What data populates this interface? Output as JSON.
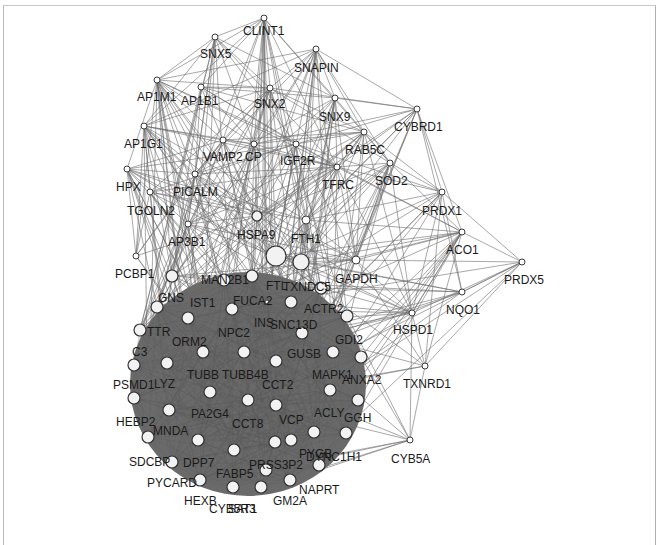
{
  "diagram": {
    "type": "protein-protein interaction network",
    "canvas": {
      "width": 665,
      "height": 532
    },
    "colors": {
      "background": "#ffffff",
      "edge": "#6e6e6e",
      "dense_cluster": "#6a6a6a",
      "node_fill": "#ffffff",
      "node_stroke": "#3a3a3a",
      "label": "#1a1a1a"
    },
    "nodes": [
      {
        "id": "CLINT1",
        "x": 264,
        "y": 18,
        "r": 3,
        "lx": 243,
        "ly": 35
      },
      {
        "id": "SNX5",
        "x": 215,
        "y": 37,
        "r": 3,
        "lx": 200,
        "ly": 58
      },
      {
        "id": "SNAPIN",
        "x": 316,
        "y": 49,
        "r": 3,
        "lx": 294,
        "ly": 72
      },
      {
        "id": "AP1M1",
        "x": 157,
        "y": 80,
        "r": 3,
        "lx": 137,
        "ly": 101
      },
      {
        "id": "AP1B1",
        "x": 201,
        "y": 87,
        "r": 3,
        "lx": 181,
        "ly": 105
      },
      {
        "id": "SNX2",
        "x": 270,
        "y": 88,
        "r": 3,
        "lx": 254,
        "ly": 108
      },
      {
        "id": "SNX9",
        "x": 335,
        "y": 98,
        "r": 3,
        "lx": 319,
        "ly": 121
      },
      {
        "id": "AP1G1",
        "x": 144,
        "y": 126,
        "r": 3,
        "lx": 124,
        "ly": 148
      },
      {
        "id": "RAB5C",
        "x": 364,
        "y": 132,
        "r": 3,
        "lx": 345,
        "ly": 154
      },
      {
        "id": "CYBRD1",
        "x": 417,
        "y": 109,
        "r": 3,
        "lx": 394,
        "ly": 131
      },
      {
        "id": "VAMP2",
        "x": 223,
        "y": 140,
        "r": 3,
        "lx": 203,
        "ly": 161
      },
      {
        "id": "CP",
        "x": 254,
        "y": 144,
        "r": 3,
        "lx": 245,
        "ly": 161
      },
      {
        "id": "IGF2R",
        "x": 296,
        "y": 144,
        "r": 3,
        "lx": 280,
        "ly": 165
      },
      {
        "id": "HPX",
        "x": 127,
        "y": 169,
        "r": 3,
        "lx": 116,
        "ly": 191
      },
      {
        "id": "PICALM",
        "x": 195,
        "y": 174,
        "r": 3,
        "lx": 173,
        "ly": 196
      },
      {
        "id": "TFRC",
        "x": 337,
        "y": 167,
        "r": 3,
        "lx": 322,
        "ly": 189
      },
      {
        "id": "SOD2",
        "x": 390,
        "y": 163,
        "r": 3,
        "lx": 375,
        "ly": 185
      },
      {
        "id": "TGOLN2",
        "x": 150,
        "y": 192,
        "r": 3,
        "lx": 127,
        "ly": 215
      },
      {
        "id": "PRDX1",
        "x": 442,
        "y": 192,
        "r": 3,
        "lx": 422,
        "ly": 215
      },
      {
        "id": "HSPA9",
        "x": 257,
        "y": 216,
        "r": 5,
        "lx": 237,
        "ly": 239
      },
      {
        "id": "FTH1",
        "x": 306,
        "y": 220,
        "r": 4,
        "lx": 291,
        "ly": 243
      },
      {
        "id": "AP3B1",
        "x": 188,
        "y": 224,
        "r": 3,
        "lx": 168,
        "ly": 246
      },
      {
        "id": "ACO1",
        "x": 462,
        "y": 232,
        "r": 3,
        "lx": 446,
        "ly": 254
      },
      {
        "id": "PCBP1",
        "x": 136,
        "y": 256,
        "r": 3,
        "lx": 115,
        "ly": 278
      },
      {
        "id": "GAPDH",
        "x": 356,
        "y": 260,
        "r": 4,
        "lx": 335,
        "ly": 283
      },
      {
        "id": "PRDX5",
        "x": 522,
        "y": 262,
        "r": 3,
        "lx": 504,
        "ly": 284
      },
      {
        "id": "NQO1",
        "x": 462,
        "y": 292,
        "r": 3,
        "lx": 446,
        "ly": 314
      },
      {
        "id": "HSPD1",
        "x": 412,
        "y": 313,
        "r": 3,
        "lx": 393,
        "ly": 334
      },
      {
        "id": "TXNRD1",
        "x": 425,
        "y": 366,
        "r": 3,
        "lx": 403,
        "ly": 388
      },
      {
        "id": "CYB5A",
        "x": 410,
        "y": 440,
        "r": 3,
        "lx": 391,
        "ly": 463
      },
      {
        "id": "HSPA5",
        "x": 276,
        "y": 256,
        "r": 10,
        "lx": 0,
        "ly": 0,
        "nolabel": true
      },
      {
        "id": "HSP90",
        "x": 301,
        "y": 262,
        "r": 8,
        "lx": 0,
        "ly": 0,
        "nolabel": true
      },
      {
        "id": "MAN2B1",
        "x": 224,
        "y": 280,
        "r": 6,
        "lx": 201,
        "ly": 284
      },
      {
        "id": "FTL",
        "x": 252,
        "y": 276,
        "r": 6,
        "lx": 266,
        "ly": 290
      },
      {
        "id": "TXNDC5",
        "x": 321,
        "y": 288,
        "r": 6,
        "lx": 283,
        "ly": 291
      },
      {
        "id": "PCBP2",
        "x": 172,
        "y": 276,
        "r": 6,
        "lx": 0,
        "ly": 0,
        "nolabel": true
      },
      {
        "id": "GNS",
        "x": 157,
        "y": 307,
        "r": 6,
        "lx": 158,
        "ly": 302
      },
      {
        "id": "IST1",
        "x": 188,
        "y": 318,
        "r": 6,
        "lx": 190,
        "ly": 307
      },
      {
        "id": "FUCA2",
        "x": 232,
        "y": 309,
        "r": 6,
        "lx": 233,
        "ly": 305
      },
      {
        "id": "ACTR2",
        "x": 291,
        "y": 302,
        "r": 6,
        "lx": 304,
        "ly": 313
      },
      {
        "id": "TTR",
        "x": 140,
        "y": 330,
        "r": 6,
        "lx": 147,
        "ly": 336
      },
      {
        "id": "INS",
        "x": 267,
        "y": 302,
        "r": 2,
        "lx": 254,
        "ly": 327
      },
      {
        "id": "SNC13D",
        "x": 302,
        "y": 333,
        "r": 6,
        "lx": 270,
        "ly": 329
      },
      {
        "id": "GDI2",
        "x": 347,
        "y": 316,
        "r": 6,
        "lx": 335,
        "ly": 344
      },
      {
        "id": "ORM2",
        "x": 203,
        "y": 352,
        "r": 6,
        "lx": 172,
        "ly": 346
      },
      {
        "id": "NPC2",
        "x": 244,
        "y": 352,
        "r": 6,
        "lx": 218,
        "ly": 337
      },
      {
        "id": "C3",
        "x": 134,
        "y": 365,
        "r": 6,
        "lx": 132,
        "ly": 356
      },
      {
        "id": "GUSB",
        "x": 333,
        "y": 352,
        "r": 6,
        "lx": 287,
        "ly": 358
      },
      {
        "id": "MAPK1",
        "x": 330,
        "y": 390,
        "r": 6,
        "lx": 312,
        "ly": 379
      },
      {
        "id": "ANXA2",
        "x": 361,
        "y": 357,
        "r": 6,
        "lx": 342,
        "ly": 384
      },
      {
        "id": "LYZ",
        "x": 167,
        "y": 363,
        "r": 6,
        "lx": 154,
        "ly": 388
      },
      {
        "id": "TUBB",
        "x": 210,
        "y": 392,
        "r": 6,
        "lx": 187,
        "ly": 379
      },
      {
        "id": "TUBB4B",
        "x": 276,
        "y": 361,
        "r": 6,
        "lx": 222,
        "ly": 379
      },
      {
        "id": "CCT2",
        "x": 248,
        "y": 400,
        "r": 6,
        "lx": 262,
        "ly": 389
      },
      {
        "id": "PSMD1",
        "x": 134,
        "y": 398,
        "r": 6,
        "lx": 113,
        "ly": 389
      },
      {
        "id": "ACLY",
        "x": 358,
        "y": 400,
        "r": 6,
        "lx": 314,
        "ly": 417
      },
      {
        "id": "GGH",
        "x": 346,
        "y": 433,
        "r": 6,
        "lx": 344,
        "ly": 422
      },
      {
        "id": "PA2G4",
        "x": 169,
        "y": 410,
        "r": 6,
        "lx": 191,
        "ly": 418
      },
      {
        "id": "CCT8",
        "x": 276,
        "y": 405,
        "r": 6,
        "lx": 232,
        "ly": 428
      },
      {
        "id": "VCP",
        "x": 291,
        "y": 440,
        "r": 6,
        "lx": 279,
        "ly": 424
      },
      {
        "id": "HEBP2",
        "x": 148,
        "y": 437,
        "r": 6,
        "lx": 116,
        "ly": 426
      },
      {
        "id": "MNDA",
        "x": 198,
        "y": 440,
        "r": 6,
        "lx": 153,
        "ly": 435
      },
      {
        "id": "PYGB",
        "x": 314,
        "y": 432,
        "r": 6,
        "lx": 299,
        "ly": 458
      },
      {
        "id": "DYNC1H1",
        "x": 319,
        "y": 465,
        "r": 6,
        "lx": 306,
        "ly": 461
      },
      {
        "id": "SDCBP",
        "x": 172,
        "y": 462,
        "r": 6,
        "lx": 129,
        "ly": 466
      },
      {
        "id": "DPP7",
        "x": 234,
        "y": 450,
        "r": 6,
        "lx": 183,
        "ly": 467
      },
      {
        "id": "FABP5",
        "x": 275,
        "y": 442,
        "r": 6,
        "lx": 216,
        "ly": 478
      },
      {
        "id": "PRSS3P2",
        "x": 266,
        "y": 470,
        "r": 6,
        "lx": 249,
        "ly": 469
      },
      {
        "id": "PYCARD",
        "x": 200,
        "y": 480,
        "r": 6,
        "lx": 147,
        "ly": 487
      },
      {
        "id": "NAPRT",
        "x": 290,
        "y": 480,
        "r": 6,
        "lx": 299,
        "ly": 494
      },
      {
        "id": "HEXB",
        "x": 233,
        "y": 487,
        "r": 6,
        "lx": 184,
        "ly": 505
      },
      {
        "id": "GM2A",
        "x": 261,
        "y": 487,
        "r": 6,
        "lx": 273,
        "ly": 505
      },
      {
        "id": "CYB5R3",
        "x": 218,
        "y": 487,
        "r": 0,
        "lx": 209,
        "ly": 513,
        "nolabel_node": true
      },
      {
        "id": "SAT1",
        "x": 260,
        "y": 487,
        "r": 0,
        "lx": 228,
        "ly": 513,
        "nolabel_node": true
      }
    ],
    "dense_cluster": {
      "center_x": 248,
      "center_y": 384,
      "rx": 118,
      "ry": 112
    }
  }
}
